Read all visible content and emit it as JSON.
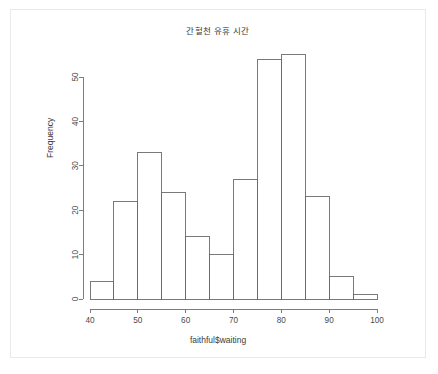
{
  "chart_data": {
    "type": "bar",
    "title": "간헐천 유휴 시간",
    "xlabel": "faithful$waiting",
    "ylabel": "Frequency",
    "categories": [
      "40-45",
      "45-50",
      "50-55",
      "55-60",
      "60-65",
      "65-70",
      "70-75",
      "75-80",
      "80-85",
      "85-90",
      "90-95",
      "95-100"
    ],
    "bin_edges": [
      40,
      45,
      50,
      55,
      60,
      65,
      70,
      75,
      80,
      85,
      90,
      95,
      100
    ],
    "values": [
      4,
      22,
      33,
      24,
      14,
      10,
      27,
      54,
      55,
      23,
      5,
      1
    ],
    "xlim": [
      40,
      100
    ],
    "ylim": [
      0,
      55
    ],
    "xticks": [
      "40",
      "50",
      "60",
      "70",
      "80",
      "90",
      "100"
    ],
    "xtick_values": [
      40,
      50,
      60,
      70,
      80,
      90,
      100
    ],
    "yticks": [
      "0",
      "10",
      "20",
      "30",
      "40",
      "50"
    ],
    "ytick_values": [
      0,
      10,
      20,
      30,
      40,
      50
    ],
    "grid": false,
    "legend": null,
    "bar_fill_color": "#ffffff",
    "bar_stroke_color": "#6a6a6a",
    "axis_color": "#6f6f6f",
    "text_color": "#3b3b3b",
    "background_color": "#ffffff",
    "panel_border_color": "#e9e9e9"
  }
}
